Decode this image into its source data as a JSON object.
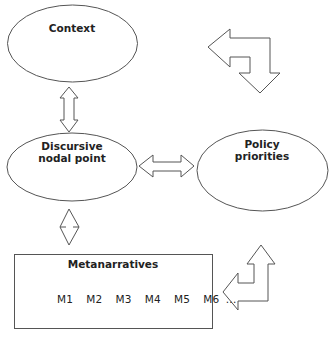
{
  "diagram": {
    "nodes": [
      {
        "id": "context",
        "label": "Context",
        "shape": "ellipse"
      },
      {
        "id": "discursive",
        "label_line1": "Discursive",
        "label_line2": "nodal point",
        "shape": "ellipse"
      },
      {
        "id": "policy",
        "label_line1": "Policy",
        "label_line2": "priorities",
        "shape": "ellipse"
      },
      {
        "id": "metanarratives",
        "label": "Metanarratives",
        "items_text": "M1  M2  M3  M4  M5  M6 ...",
        "items": [
          "M1",
          "M2",
          "M3",
          "M4",
          "M5",
          "M6",
          "..."
        ],
        "shape": "rectangle"
      }
    ],
    "edges": [
      {
        "from": "context",
        "to": "discursive",
        "type": "double-arrow"
      },
      {
        "from": "discursive",
        "to": "policy",
        "type": "double-arrow"
      },
      {
        "from": "discursive",
        "to": "metanarratives",
        "type": "double-arrow"
      },
      {
        "from": "policy",
        "to": "context",
        "type": "bent-arrow"
      },
      {
        "from": "metanarratives",
        "to": "policy",
        "type": "bent-arrow"
      }
    ],
    "colors": {
      "stroke": "#555555",
      "text": "#222222",
      "background": "#ffffff"
    }
  }
}
